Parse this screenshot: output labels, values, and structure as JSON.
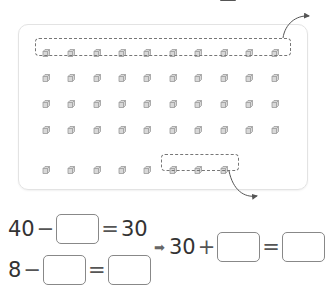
{
  "illustration": {
    "rows": [
      {
        "cubes": 10,
        "grouped": true
      },
      {
        "cubes": 10,
        "grouped": false
      },
      {
        "cubes": 10,
        "grouped": false
      },
      {
        "cubes": 10,
        "grouped": false
      },
      {
        "cubes": 8,
        "grouped_last": 3
      }
    ],
    "cube_icon": "cube-icon",
    "colors": {
      "cube": "#9a9a9a",
      "panel_border": "#e3e3e3",
      "dashed": "#777777"
    }
  },
  "equations": {
    "eq1": {
      "left": "40",
      "op1": "−",
      "blank1": "",
      "eq": "=",
      "right": "30"
    },
    "eq2": {
      "left": "8",
      "op1": "−",
      "blank1": "",
      "eq": "=",
      "blank2": ""
    },
    "eq3": {
      "arrow": "➡",
      "left": "30",
      "op1": "+",
      "blank1": "",
      "eq": "=",
      "blank2": ""
    }
  }
}
